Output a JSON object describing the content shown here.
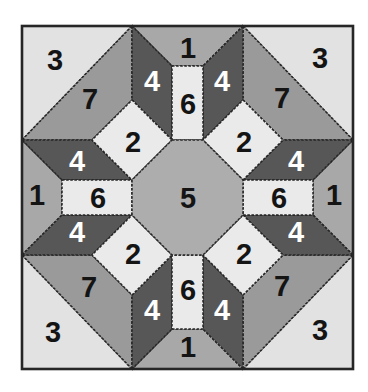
{
  "diagram": {
    "name": "pieced quilt block pattern",
    "background": "#ffffff"
  },
  "colors": {
    "piece_1": "#a8a8a8",
    "piece_2": "#eaeaea",
    "piece_3": "#e2e2e2",
    "piece_4": "#575757",
    "piece_5": "#adadad",
    "piece_6": "#eaeaea",
    "piece_7": "#9a9a9a",
    "outline": "#262626",
    "label_on_light": "#141414",
    "label_on_dark": "#ffffff"
  },
  "pieces": {
    "corner_tl": {
      "label": "3"
    },
    "corner_tr": {
      "label": "3"
    },
    "corner_bl": {
      "label": "3"
    },
    "corner_br": {
      "label": "3"
    },
    "band_tl": {
      "label": "7"
    },
    "band_tr": {
      "label": "7"
    },
    "band_bl": {
      "label": "7"
    },
    "band_br": {
      "label": "7"
    },
    "edge_top": {
      "label": "1"
    },
    "edge_bottom": {
      "label": "1"
    },
    "edge_left": {
      "label": "1"
    },
    "edge_right": {
      "label": "1"
    },
    "wedge_top_left": {
      "label": "4"
    },
    "wedge_top_right": {
      "label": "4"
    },
    "wedge_left_upper": {
      "label": "4"
    },
    "wedge_left_lower": {
      "label": "4"
    },
    "wedge_right_upper": {
      "label": "4"
    },
    "wedge_right_lower": {
      "label": "4"
    },
    "wedge_bottom_left": {
      "label": "4"
    },
    "wedge_bottom_right": {
      "label": "4"
    },
    "bar_top": {
      "label": "6"
    },
    "bar_bottom": {
      "label": "6"
    },
    "bar_left": {
      "label": "6"
    },
    "bar_right": {
      "label": "6"
    },
    "diamond_tl": {
      "label": "2"
    },
    "diamond_tr": {
      "label": "2"
    },
    "diamond_bl": {
      "label": "2"
    },
    "diamond_br": {
      "label": "2"
    },
    "center_octagon": {
      "label": "5"
    }
  }
}
